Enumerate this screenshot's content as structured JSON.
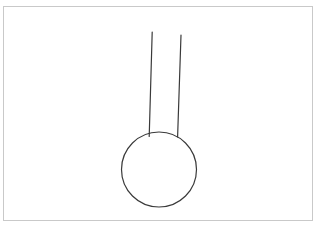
{
  "canvas": {
    "width": 328,
    "height": 234,
    "background_color": "#ffffff",
    "description": "line-drawing-sketch"
  },
  "frame": {
    "name": "drawing-frame-border",
    "x": 3,
    "y": 6,
    "width": 310,
    "height": 215,
    "stroke_color": "#c9c9c9",
    "stroke_width": 1,
    "fill_color": "#ffffff"
  },
  "drawing": {
    "title": "thermometer-bulb-outline",
    "stroke_color": "#3a3a3a",
    "stroke_width": 1.2,
    "fill": "none",
    "shapes": [
      {
        "name": "bulb-circle",
        "type": "circle",
        "cx": 159,
        "cy": 169.5,
        "r": 37.5
      },
      {
        "name": "stem-line-left",
        "type": "line",
        "x1": 152.2,
        "y1": 32,
        "x2": 149.2,
        "y2": 136.5
      },
      {
        "name": "stem-line-right",
        "type": "line",
        "x1": 181.0,
        "y1": 35,
        "x2": 177.6,
        "y2": 137.0
      }
    ]
  }
}
